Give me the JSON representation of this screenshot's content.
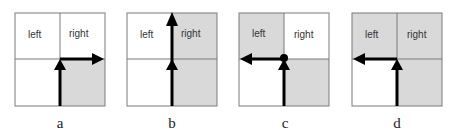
{
  "figure": {
    "colors": {
      "shaded": "#d9d9d9",
      "white": "#ffffff",
      "grid": "#7a7a7a",
      "arrow": "#000000"
    },
    "panels": [
      {
        "id": "a",
        "label": "a",
        "cells": {
          "tl": "white",
          "tr": "white",
          "bl": "white",
          "br": "shaded"
        },
        "text": {
          "left": "left",
          "right": "right"
        },
        "path": "up-then-right"
      },
      {
        "id": "b",
        "label": "b",
        "cells": {
          "tl": "white",
          "tr": "shaded",
          "bl": "white",
          "br": "shaded"
        },
        "text": {
          "left": "left",
          "right": "right"
        },
        "path": "straight-up"
      },
      {
        "id": "c",
        "label": "c",
        "cells": {
          "tl": "shaded",
          "tr": "white",
          "bl": "white",
          "br": "shaded"
        },
        "text": {
          "left": "left",
          "right": "right"
        },
        "path": "up-then-left-with-node"
      },
      {
        "id": "d",
        "label": "d",
        "cells": {
          "tl": "shaded",
          "tr": "shaded",
          "bl": "white",
          "br": "shaded"
        },
        "text": {
          "left": "left",
          "right": "right"
        },
        "path": "up-then-left"
      }
    ]
  }
}
